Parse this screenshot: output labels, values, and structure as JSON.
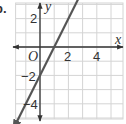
{
  "problem_label": "b.",
  "chart_data": {
    "type": "line",
    "title": "",
    "xlabel": "x",
    "ylabel": "y",
    "origin_label": "O",
    "xlim": [
      -2,
      6
    ],
    "ylim": [
      -5,
      3
    ],
    "grid": true,
    "x_ticks": [
      {
        "value": 2,
        "label": "2"
      },
      {
        "value": 4,
        "label": "4"
      }
    ],
    "y_ticks": [
      {
        "value": 2,
        "label": "2"
      },
      {
        "value": -2,
        "label": "-2"
      },
      {
        "value": -4,
        "label": "-4"
      }
    ],
    "series": [
      {
        "name": "line",
        "equation": "y = 2x - 2",
        "slope": 2,
        "intercept": -2,
        "x": [
          -1.9,
          3.3
        ],
        "y": [
          -5.8,
          4.6
        ],
        "arrows": "both",
        "color": "#555555"
      }
    ],
    "axis_color": "#333333",
    "grid_color": "#d4d4d4"
  },
  "labels": {
    "x_axis": "x",
    "y_axis": "y",
    "origin": "O",
    "x_tick_2": "2",
    "x_tick_4": "4",
    "y_tick_2": "2",
    "y_tick_neg2": "−2",
    "y_tick_neg4": "−4"
  }
}
